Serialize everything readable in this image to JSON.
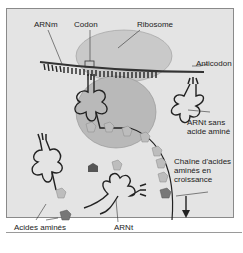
{
  "diagram": {
    "labels": {
      "mrna": "ARNm",
      "codon": "Codon",
      "ribosome": "Ribosome",
      "anticodon": "Anticodon",
      "trna_without_amino_acid_line1": "ARNt sans",
      "trna_without_amino_acid_line2": "acide aminé",
      "growing_chain_line1": "Chaîne d'acides",
      "growing_chain_line2": "aminés en",
      "growing_chain_line3": "croissance",
      "trna": "ARNt",
      "amino_acids": "Acides aminés"
    },
    "colors": {
      "background": "#e4e4e4",
      "ribosome_large": "#c9c9c9",
      "ribosome_small": "#b8b8b8",
      "amino_acid_light": "#bdbdbd",
      "amino_acid_dark": "#555555",
      "line": "#222222"
    }
  }
}
